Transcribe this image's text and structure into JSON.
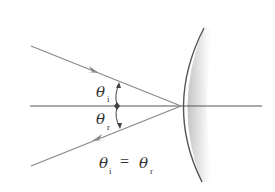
{
  "diagram": {
    "colors": {
      "ray": "#8a8a8a",
      "axis": "#555555",
      "mirror": "#555555",
      "mirror_shade": "#bdbdbd",
      "text": "#333333",
      "background": "#ffffff"
    },
    "labels": {
      "theta_i": {
        "symbol": "θ",
        "subscript": "i"
      },
      "theta_r": {
        "symbol": "θ",
        "subscript": "r"
      },
      "equation": {
        "lhs_symbol": "θ",
        "lhs_subscript": "i",
        "operator": "=",
        "rhs_symbol": "θ",
        "rhs_subscript": "r"
      }
    },
    "elements": {
      "incident_ray": {
        "start": [
          31,
          46
        ],
        "end": [
          181,
          106
        ],
        "arrow_at": [
          96,
          72
        ],
        "direction": "toward-mirror"
      },
      "reflected_ray": {
        "start": [
          181,
          106
        ],
        "end": [
          31,
          166
        ],
        "arrow_at": [
          96,
          140
        ],
        "direction": "away-from-mirror"
      },
      "normal_axis": {
        "start": [
          30,
          106
        ],
        "end": [
          262,
          106
        ]
      },
      "mirror": {
        "type": "concave",
        "top": [
          204,
          28
        ],
        "vertex": [
          181,
          106
        ],
        "bottom": [
          202,
          182
        ]
      },
      "angle_arc": {
        "x": 117,
        "top": 83,
        "bottom": 128
      }
    }
  }
}
